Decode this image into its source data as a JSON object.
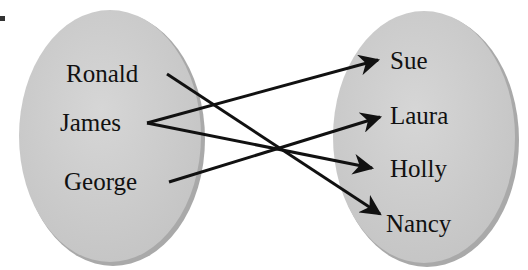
{
  "diagram": {
    "type": "mapping",
    "domain_set": {
      "items": [
        {
          "label": "Ronald",
          "x": 66,
          "y": 82
        },
        {
          "label": "James",
          "x": 60,
          "y": 131
        },
        {
          "label": "George",
          "x": 64,
          "y": 190
        }
      ]
    },
    "range_set": {
      "items": [
        {
          "label": "Sue",
          "x": 390,
          "y": 69
        },
        {
          "label": "Laura",
          "x": 390,
          "y": 124
        },
        {
          "label": "Holly",
          "x": 390,
          "y": 177
        },
        {
          "label": "Nancy",
          "x": 386,
          "y": 232
        }
      ]
    },
    "mappings": [
      {
        "from": "Ronald",
        "to": "Nancy"
      },
      {
        "from": "James",
        "to": "Sue"
      },
      {
        "from": "James",
        "to": "Holly"
      },
      {
        "from": "George",
        "to": "Laura"
      }
    ],
    "colors": {
      "ellipse_fill": "#cfcfcf",
      "ellipse_shadow": "#a9a9a9",
      "arrow": "#111111",
      "text": "#111111"
    }
  }
}
